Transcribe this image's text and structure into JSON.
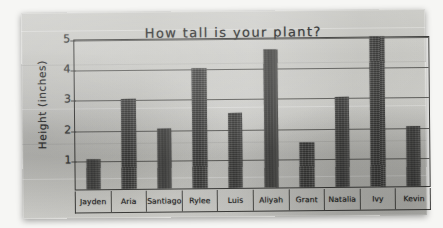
{
  "chart_data": {
    "type": "bar",
    "title": "How tall is your plant?",
    "xlabel": "",
    "ylabel": "Height (inches)",
    "ylim": [
      0,
      5
    ],
    "yticks": [
      1,
      2,
      3,
      4,
      5
    ],
    "ytick_labels": [
      "1",
      "2",
      "3",
      "4",
      "5"
    ],
    "grid": true,
    "legend": "none",
    "categories": [
      "Jayden",
      "Aria",
      "Santiago",
      "Rylee",
      "Luis",
      "Aliyah",
      "Grant",
      "Natalia",
      "Ivy",
      "Kevin"
    ],
    "values": [
      1,
      3,
      2,
      4,
      2.5,
      4.6,
      1.5,
      3,
      5,
      2
    ],
    "bar_color": "#45453f",
    "medium": "hand-drawn bar graph on gray chart paper"
  },
  "poster": {
    "paper_color": "#c6c6c1",
    "ink_color": "#2b2b2b"
  }
}
